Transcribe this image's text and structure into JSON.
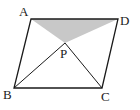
{
  "figure": {
    "type": "parallelogram-with-diagonals",
    "colors": {
      "stroke": "#1a1a1a",
      "shade": "#c8c8c8",
      "background": "#ffffff"
    },
    "points": {
      "A": {
        "label": "A",
        "x": 31,
        "y": 19,
        "lx": 19,
        "ly": 16
      },
      "D": {
        "label": "D",
        "x": 118,
        "y": 19,
        "lx": 120,
        "ly": 25
      },
      "P": {
        "label": "P",
        "x": 65,
        "y": 43,
        "lx": 60,
        "ly": 58
      },
      "B": {
        "label": "B",
        "x": 14,
        "y": 88,
        "lx": 3,
        "ly": 99
      },
      "C": {
        "label": "C",
        "x": 102,
        "y": 88,
        "lx": 101,
        "ly": 101
      }
    },
    "shaded_region": "Triangle APD"
  }
}
